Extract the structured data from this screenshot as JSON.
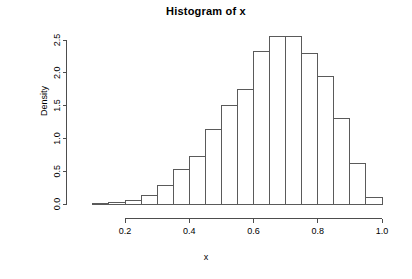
{
  "chart_data": {
    "type": "bar",
    "subtype": "histogram",
    "title": "Histogram of x",
    "xlabel": "x",
    "ylabel": "Density",
    "xlim": [
      0.1,
      1.0
    ],
    "ylim": [
      0.0,
      2.6
    ],
    "grid": false,
    "legend": null,
    "bin_width": 0.05,
    "bin_edges": [
      0.1,
      0.15,
      0.2,
      0.25,
      0.3,
      0.35,
      0.4,
      0.45,
      0.5,
      0.55,
      0.6,
      0.65,
      0.7,
      0.75,
      0.8,
      0.85,
      0.9,
      0.95,
      1.0
    ],
    "categories": [
      "0.10-0.15",
      "0.15-0.20",
      "0.20-0.25",
      "0.25-0.30",
      "0.30-0.35",
      "0.35-0.40",
      "0.40-0.45",
      "0.45-0.50",
      "0.50-0.55",
      "0.55-0.60",
      "0.60-0.65",
      "0.65-0.70",
      "0.70-0.75",
      "0.75-0.80",
      "0.80-0.85",
      "0.85-0.90",
      "0.90-0.95",
      "0.95-1.00"
    ],
    "values": [
      0.01,
      0.02,
      0.05,
      0.13,
      0.28,
      0.53,
      0.72,
      1.13,
      1.5,
      1.75,
      2.33,
      2.56,
      2.56,
      2.3,
      1.94,
      1.3,
      0.61,
      0.1
    ],
    "xticks": [
      0.2,
      0.4,
      0.6,
      0.8,
      1.0
    ],
    "xtick_labels": [
      "0.2",
      "0.4",
      "0.6",
      "0.8",
      "1.0"
    ],
    "yticks": [
      0.0,
      0.5,
      1.0,
      1.5,
      2.0,
      2.5
    ],
    "ytick_labels": [
      "0.0",
      "0.5",
      "1.0",
      "1.5",
      "2.0",
      "2.5"
    ],
    "colors": {
      "bar_fill": "#ffffff",
      "bar_stroke": "#5a5a5a",
      "axis": "#4d4d4d",
      "text": "#000000",
      "background": "#ffffff"
    }
  }
}
